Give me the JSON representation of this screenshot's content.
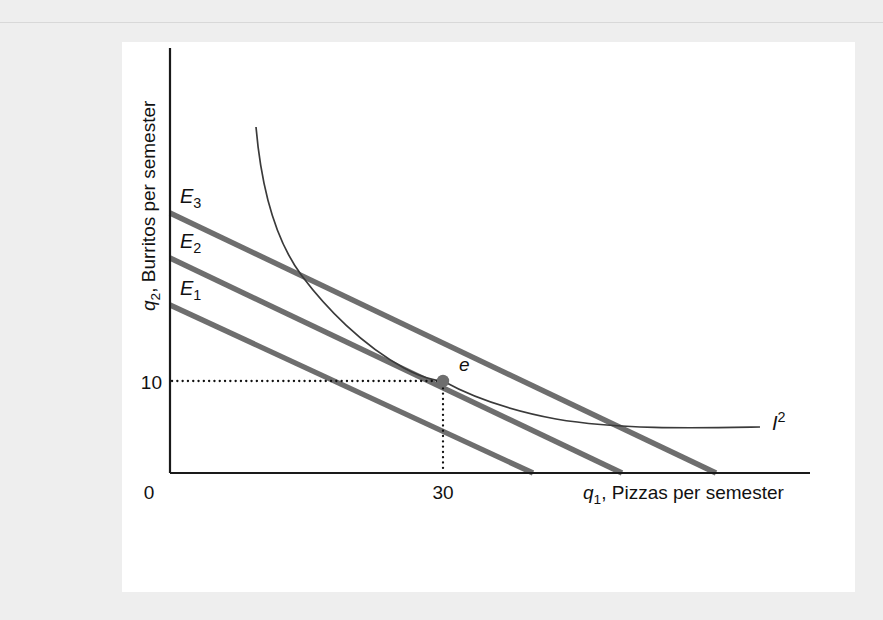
{
  "page": {
    "background_color": "#eeeeee",
    "panel_color": "#ffffff"
  },
  "figure": {
    "axes": {
      "x_axis_title_var": "q",
      "x_axis_title_sub": "1",
      "x_axis_title_text": ", Pizzas per semester",
      "y_axis_title_var": "q",
      "y_axis_title_sub": "2",
      "y_axis_title_text": ", Burritos per semester",
      "origin_label": "0",
      "x_tick_label": "30",
      "y_tick_label": "10"
    },
    "budget_lines": [
      {
        "label_var": "E",
        "label_sub": "1",
        "name": "budget-line-e1",
        "color": "#6e6e6e"
      },
      {
        "label_var": "E",
        "label_sub": "2",
        "name": "budget-line-e2",
        "color": "#6e6e6e"
      },
      {
        "label_var": "E",
        "label_sub": "3",
        "name": "budget-line-e3",
        "color": "#6e6e6e"
      }
    ],
    "indifference_curve": {
      "label_var": "I",
      "label_sup": "2",
      "color": "#3a3a3a"
    },
    "equilibrium_point": {
      "label": "e",
      "color": "#6e6e6e"
    }
  },
  "chart_data": {
    "type": "line",
    "title": "",
    "xlabel": "q1, Pizzas per semester",
    "ylabel": "q2, Burritos per semester",
    "xlim": [
      0,
      70
    ],
    "ylim": [
      0,
      29
    ],
    "grid": false,
    "legend": "inline-labels",
    "x_ticks": [
      0,
      30
    ],
    "x_tick_labels": [
      "0",
      "30"
    ],
    "y_ticks": [
      10
    ],
    "y_tick_labels": [
      "10"
    ],
    "series": [
      {
        "name": "E1",
        "type": "budget-line",
        "label": "E1",
        "color": "#6e6e6e",
        "x": [
          0,
          30
        ],
        "y": [
          13.8,
          0
        ],
        "y_intercept": 13.8,
        "x_intercept": 30,
        "note": "lowest parallel budget line"
      },
      {
        "name": "E2",
        "type": "budget-line",
        "label": "E2",
        "color": "#6e6e6e",
        "x": [
          0,
          37.4
        ],
        "y": [
          17.2,
          0
        ],
        "y_intercept": 17.2,
        "x_intercept": 37.4,
        "note": "middle budget line, tangent to I2 at point e"
      },
      {
        "name": "E3",
        "type": "budget-line",
        "label": "E3",
        "color": "#6e6e6e",
        "x": [
          0,
          45.1
        ],
        "y": [
          20.5,
          0
        ],
        "y_intercept": 20.5,
        "x_intercept": 45.1,
        "note": "highest parallel budget line"
      },
      {
        "name": "I2",
        "type": "indifference-curve",
        "label": "I2",
        "color": "#3a3a3a",
        "x": [
          7.1,
          9,
          12,
          16,
          20,
          25,
          30,
          36,
          43,
          50,
          58,
          66
        ],
        "y": [
          25.3,
          21.5,
          17.3,
          14.0,
          12.2,
          11.0,
          10.0,
          8.8,
          7.9,
          7.3,
          6.9,
          6.6
        ],
        "note": "convex to origin, tangent to E2 at (30,10)"
      }
    ],
    "annotations": [
      {
        "name": "equilibrium-point",
        "label": "e",
        "x": 30,
        "y": 10,
        "marker": "filled-circle",
        "color": "#6e6e6e",
        "note": "optimal bundle; tangency of I2 and budget line E2"
      },
      {
        "name": "horizontal-guide",
        "style": "dotted",
        "from": [
          0,
          10
        ],
        "to": [
          30,
          10
        ]
      },
      {
        "name": "vertical-guide",
        "style": "dotted",
        "from": [
          30,
          10
        ],
        "to": [
          30,
          0
        ]
      }
    ]
  }
}
